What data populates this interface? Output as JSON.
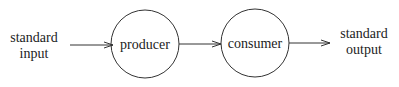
{
  "diagram": {
    "nodes": [
      {
        "id": "stdin",
        "label_lines": [
          "standard",
          "input"
        ],
        "shape": "text"
      },
      {
        "id": "producer",
        "label": "producer",
        "shape": "circle"
      },
      {
        "id": "consumer",
        "label": "consumer",
        "shape": "circle"
      },
      {
        "id": "stdout",
        "label_lines": [
          "standard",
          "output"
        ],
        "shape": "text"
      }
    ],
    "edges": [
      {
        "from": "stdin",
        "to": "producer"
      },
      {
        "from": "producer",
        "to": "consumer"
      },
      {
        "from": "consumer",
        "to": "stdout"
      }
    ],
    "colors": {
      "stroke": "#333333",
      "text": "#222222",
      "background": "#ffffff"
    }
  }
}
